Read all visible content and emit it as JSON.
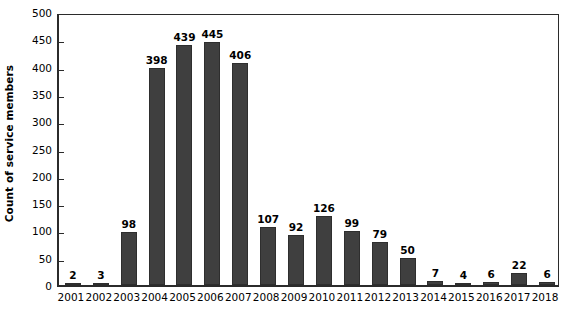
{
  "chart_data": {
    "type": "bar",
    "title": "",
    "xlabel": "",
    "ylabel": "Count of service members",
    "categories": [
      "2001",
      "2002",
      "2003",
      "2004",
      "2005",
      "2006",
      "2007",
      "2008",
      "2009",
      "2010",
      "2011",
      "2012",
      "2013",
      "2014",
      "2015",
      "2016",
      "2017",
      "2018"
    ],
    "values": [
      2,
      3,
      98,
      398,
      439,
      445,
      406,
      107,
      92,
      126,
      99,
      79,
      50,
      7,
      4,
      6,
      22,
      6
    ],
    "data_labels": [
      "2",
      "3",
      "98",
      "398",
      "439",
      "445",
      "406",
      "107",
      "92",
      "126",
      "99",
      "79",
      "50",
      "7",
      "4",
      "6",
      "22",
      "6"
    ],
    "ylim": [
      0,
      500
    ],
    "yticks": [
      0,
      50,
      100,
      150,
      200,
      250,
      300,
      350,
      400,
      450,
      500
    ],
    "ytick_labels": [
      "0",
      "50",
      "100",
      "150",
      "200",
      "250",
      "300",
      "350",
      "400",
      "450",
      "500"
    ],
    "grid": false,
    "legend": false,
    "legend_position": "none",
    "bar_color": "#3f3f3f",
    "bar_edge_color": "#2e2e2e",
    "axis_color": "#2b2b2b",
    "background_color": "#ffffff",
    "text_color": "#000000"
  }
}
